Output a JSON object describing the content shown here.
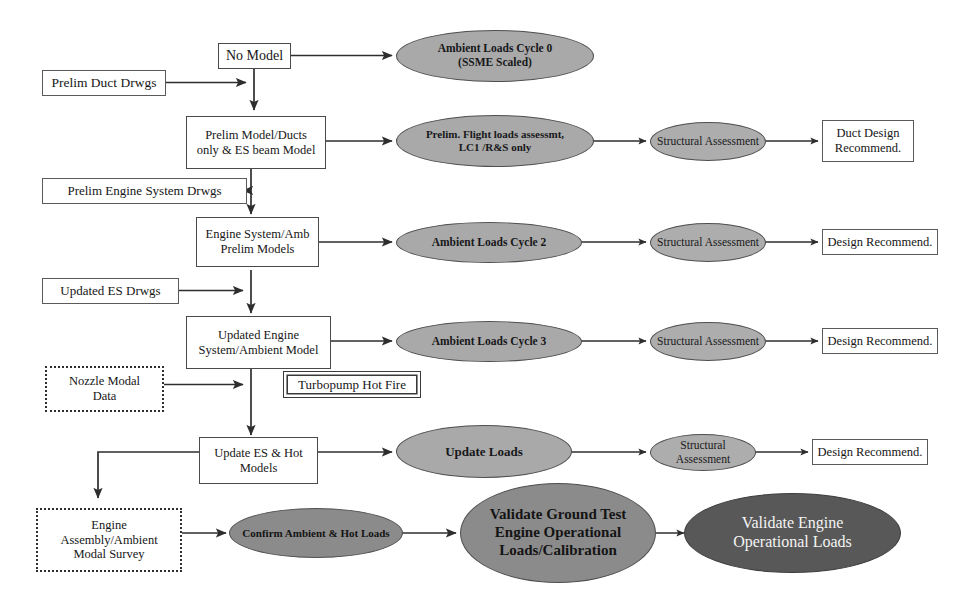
{
  "diagram": {
    "colors": {
      "light_gray_ellipse": "#a9a9a9",
      "mid_gray_ellipse": "#8b8b8b",
      "dark_gray_ellipse": "#585858",
      "box_border": "#4a4a4a",
      "connector": "#2e2e2e",
      "background": "#ffffff"
    },
    "nodes": {
      "no_model": "No Model",
      "prelim_duct_drwgs": "Prelim Duct Drwgs",
      "prelim_model_ducts": "Prelim  Model/Ducts\nonly & ES beam Model",
      "prelim_model_ducts_l1": "Prelim  Model/Ducts",
      "prelim_model_ducts_l2": "only & ES beam Model",
      "prelim_engine_system_drwgs": "Prelim Engine System Drwgs",
      "engine_system_amb_l1": "Engine System/Amb",
      "engine_system_amb_l2": "Prelim  Models",
      "updated_es_drwgs": "Updated ES Drwgs",
      "updated_engine_l1": "Updated Engine",
      "updated_engine_l2": "System/Ambient  Model",
      "nozzle_modal_l1": "Nozzle Modal",
      "nozzle_modal_l2": "Data",
      "turbopump_hot_fire": "Turbopump Hot Fire",
      "update_es_hot_l1": "Update ES & Hot",
      "update_es_hot_l2": "Models",
      "engine_assembly_l1": "Engine",
      "engine_assembly_l2": "Assembly/Ambient",
      "engine_assembly_l3": "Modal Survey",
      "ambient_loads_cycle_0_l1": "Ambient Loads Cycle 0",
      "ambient_loads_cycle_0_l2": "(SSME Scaled)",
      "prelim_flight_loads_l1": "Prelim. Flight loads assessmt,",
      "prelim_flight_loads_l2": "LC1 /R&S only",
      "ambient_loads_cycle_2": "Ambient Loads Cycle 2",
      "ambient_loads_cycle_3": "Ambient Loads Cycle 3",
      "update_loads": "Update Loads",
      "confirm_ambient_hot_loads": "Confirm Ambient & Hot Loads",
      "structural_assessment_1": "Structural Assessment",
      "structural_assessment_2": "Structural Assessment",
      "structural_assessment_3": "Structural Assessment",
      "structural_assessment_4": "Structural Assessment",
      "duct_design_recommend_l1": "Duct Design",
      "duct_design_recommend_l2": "Recommend.",
      "design_recommend_1": "Design Recommend.",
      "design_recommend_2": "Design Recommend.",
      "design_recommend_3": "Design Recommend.",
      "validate_ground_test_l1": "Validate Ground Test",
      "validate_ground_test_l2": "Engine Operational",
      "validate_ground_test_l3": "Loads/Calibration",
      "validate_engine_l1": "Validate Engine",
      "validate_engine_l2": "Operational Loads"
    }
  }
}
